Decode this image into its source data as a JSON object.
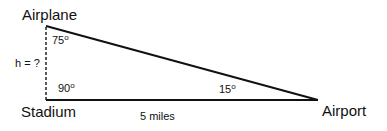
{
  "diagram": {
    "type": "right-triangle word problem",
    "vertices": {
      "top": "Airplane",
      "bottom_left": "Stadium",
      "bottom_right": "Airport"
    },
    "angles": {
      "airplane": "75",
      "stadium": "90",
      "airport": "15",
      "degree_mark": "o"
    },
    "sides": {
      "height": "h = ?",
      "base": "5 miles"
    }
  }
}
